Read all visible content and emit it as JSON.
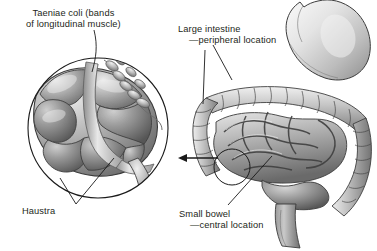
{
  "figure": {
    "style": "grayscale medical illustration",
    "background_color": "#ffffff",
    "ink_color": "#231f20"
  },
  "labels": {
    "taeniae_coli": {
      "line1": "Taeniae coli (bands",
      "line2": "of longitudinal muscle)"
    },
    "large_intestine": {
      "line1": "Large intestine",
      "line2": "—peripheral location"
    },
    "haustra": {
      "line1": "Haustra"
    },
    "small_bowel": {
      "line1": "Small bowel",
      "line2": "—central location"
    }
  },
  "inset": {
    "name": "magnified-cecum-detail",
    "shape": "circle",
    "center_x": 98,
    "center_y": 128,
    "radius": 70,
    "contents": "cecum with haustra, taeniae coli, terminal ileum and appendix"
  },
  "callout": {
    "marker_shape": "circle",
    "marker_center_x": 232,
    "marker_center_y": 167,
    "marker_radius": 18,
    "arrow_direction": "left",
    "arrow_from_x": 218,
    "arrow_to_x": 178,
    "arrow_y": 158
  },
  "anatomy": {
    "organs": [
      "stomach",
      "transverse colon",
      "ascending colon",
      "descending colon",
      "sigmoid colon",
      "rectum",
      "small bowel loops",
      "cecum",
      "appendix",
      "terminal ileum"
    ]
  },
  "palette": {
    "ink": "#231f20",
    "outline": "#1a1a1a",
    "tissue_light": "#e2e2e2",
    "tissue_mid": "#b4b4b4",
    "tissue_dark": "#7c7c7c",
    "tissue_shadow": "#5a5a5a",
    "highlight": "#f4f4f4"
  }
}
